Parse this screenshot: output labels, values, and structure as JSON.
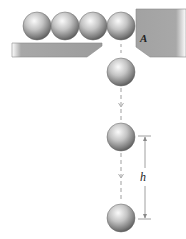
{
  "diagram": {
    "labels": {
      "block": "A",
      "height": "h"
    },
    "colors": {
      "ball_light": "#f2f2f2",
      "ball_mid": "#b8b8b8",
      "ball_dark": "#6a6a6a",
      "surface": "#a6a6a6",
      "surface_edge": "#8c8c8c",
      "dashed_line": "#b0b0b0",
      "dimension_line": "#888888"
    },
    "row_balls": [
      {
        "cx": 37,
        "cy": 26
      },
      {
        "cx": 65,
        "cy": 26
      },
      {
        "cx": 93,
        "cy": 26
      },
      {
        "cx": 121,
        "cy": 26
      }
    ],
    "falling_balls": [
      {
        "cx": 121,
        "cy": 72
      },
      {
        "cx": 121,
        "cy": 137
      },
      {
        "cx": 121,
        "cy": 218
      }
    ],
    "ball_radius": 14
  }
}
